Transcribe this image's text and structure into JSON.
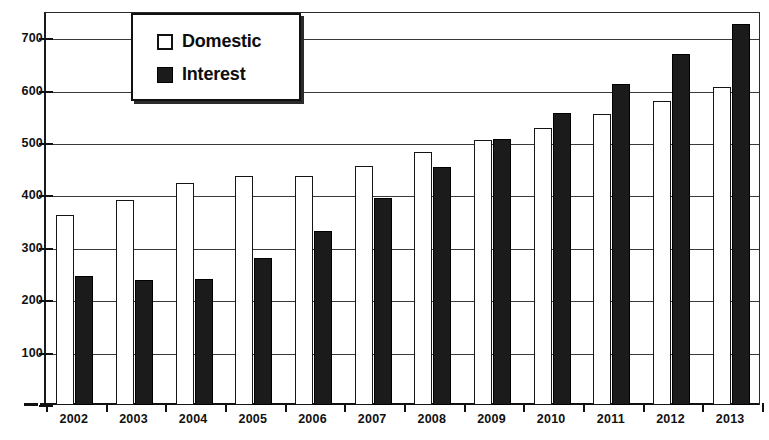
{
  "chart_data": {
    "type": "bar",
    "title": "",
    "subtitle": "",
    "xlabel": "",
    "ylabel": "",
    "ylim": [
      0,
      750
    ],
    "grid": true,
    "legend_position": "top-left-inside",
    "categories": [
      "2002",
      "2003",
      "2004",
      "2005",
      "2006",
      "2007",
      "2008",
      "2009",
      "2010",
      "2011",
      "2012",
      "2013"
    ],
    "ytick_labels": [
      "700",
      "600",
      "500",
      "400",
      "300",
      "200",
      "100",
      "-"
    ],
    "ytick_values": [
      700,
      600,
      500,
      400,
      300,
      200,
      100,
      0
    ],
    "series": [
      {
        "name": "Domestic",
        "style": "hollow-white",
        "values": [
          362,
          392,
          423,
          437,
          437,
          457,
          482,
          506,
          528,
          555,
          580,
          607
        ]
      },
      {
        "name": "Interest",
        "style": "solid-black",
        "values": [
          246,
          239,
          240,
          281,
          333,
          396,
          455,
          507,
          558,
          613,
          670,
          728
        ]
      }
    ]
  },
  "legend": {
    "items": [
      {
        "label": "Domestic",
        "swatch": "hollow-square-icon"
      },
      {
        "label": "Interest",
        "swatch": "filled-square-icon"
      }
    ]
  }
}
